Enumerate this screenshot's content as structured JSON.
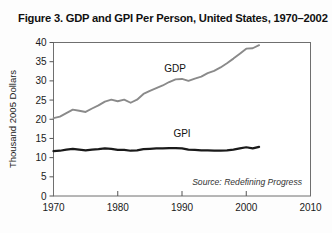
{
  "figure": {
    "title": "Figure 3. GDP and GPI Per Person, United States, 1970–2002",
    "source": "Source: Redefining Progress"
  },
  "axes": {
    "ylabel": "Thousand 2005 Dollars",
    "y_ticks": [
      "0",
      "5",
      "10",
      "15",
      "20",
      "25",
      "30",
      "35",
      "40"
    ],
    "x_ticks": [
      "1970",
      "1980",
      "1990",
      "2000",
      "2010"
    ]
  },
  "series_labels": {
    "gdp": "GDP",
    "gpi": "GPI"
  },
  "colors": {
    "gdp_line": "#8a8a8a",
    "gpi_line": "#1a1a1a",
    "axis": "#555555",
    "background": "#fdfdfd"
  },
  "chart_data": {
    "type": "line",
    "title": "Figure 3. GDP and GPI Per Person, United States, 1970–2002",
    "xlabel": "",
    "ylabel": "Thousand 2005 Dollars",
    "xlim": [
      1970,
      2010
    ],
    "ylim": [
      0,
      40
    ],
    "y_ticks": [
      0,
      5,
      10,
      15,
      20,
      25,
      30,
      35,
      40
    ],
    "x_ticks": [
      1970,
      1980,
      1990,
      2000,
      2010
    ],
    "grid": false,
    "legend": "inline-labels",
    "annotations": [
      {
        "text": "GDP",
        "x": 1988,
        "y": 29.5
      },
      {
        "text": "GPI",
        "x": 1990,
        "y": 15.0
      },
      {
        "text": "Source: Redefining Progress",
        "x": 2004,
        "y": 4.5
      }
    ],
    "x": [
      1970,
      1971,
      1972,
      1973,
      1974,
      1975,
      1976,
      1977,
      1978,
      1979,
      1980,
      1981,
      1982,
      1983,
      1984,
      1985,
      1986,
      1987,
      1988,
      1989,
      1990,
      1991,
      1992,
      1993,
      1994,
      1995,
      1996,
      1997,
      1998,
      1999,
      2000,
      2001,
      2002
    ],
    "series": [
      {
        "name": "GDP",
        "color": "#8a8a8a",
        "values": [
          20.3,
          20.7,
          21.6,
          22.5,
          22.2,
          21.9,
          22.8,
          23.6,
          24.6,
          25.1,
          24.7,
          25.1,
          24.3,
          25.1,
          26.6,
          27.4,
          28.1,
          28.8,
          29.7,
          30.4,
          30.5,
          30.0,
          30.6,
          31.1,
          32.0,
          32.6,
          33.5,
          34.6,
          35.8,
          37.1,
          38.4,
          38.5,
          39.3
        ]
      },
      {
        "name": "GPI",
        "color": "#1a1a1a",
        "values": [
          11.7,
          11.8,
          12.1,
          12.3,
          12.1,
          11.9,
          12.1,
          12.2,
          12.4,
          12.3,
          12.0,
          12.0,
          11.8,
          11.9,
          12.2,
          12.3,
          12.4,
          12.4,
          12.5,
          12.5,
          12.4,
          12.1,
          12.0,
          11.9,
          11.9,
          11.8,
          11.8,
          11.9,
          12.1,
          12.4,
          12.7,
          12.4,
          12.8
        ]
      }
    ]
  }
}
